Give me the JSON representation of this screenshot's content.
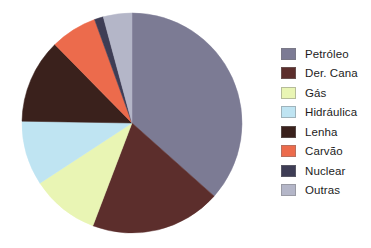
{
  "chart_data": {
    "type": "pie",
    "title": "",
    "subtitle": "",
    "xlabel": "",
    "ylabel": "",
    "grid": false,
    "legend_position": "right",
    "start_angle_deg": 0,
    "direction": "clockwise",
    "units": "percent",
    "categories": [
      "Petróleo",
      "Der. Cana",
      "Gás",
      "Hidráulica",
      "Lenha",
      "Carvão",
      "Nuclear",
      "Outras"
    ],
    "values": [
      38.6,
      20.3,
      10.6,
      10.0,
      13.1,
      7.2,
      1.4,
      4.4
    ],
    "angles_deg": [
      139.0,
      73.0,
      38.0,
      36.0,
      47.0,
      26.0,
      5.0,
      16.0
    ],
    "colors": [
      "#7c7b94",
      "#5c2e2c",
      "#e9f5b4",
      "#bfe4f2",
      "#3a211c",
      "#ec6b4c",
      "#3e3d55",
      "#b4b6c8"
    ],
    "slices": [
      {
        "label": "Petróleo",
        "value": 38.6,
        "angle_deg": 139.0,
        "color": "#7c7b94"
      },
      {
        "label": "Der. Cana",
        "value": 20.3,
        "angle_deg": 73.0,
        "color": "#5c2e2c"
      },
      {
        "label": "Gás",
        "value": 10.6,
        "angle_deg": 38.0,
        "color": "#e9f5b4"
      },
      {
        "label": "Hidráulica",
        "value": 10.0,
        "angle_deg": 36.0,
        "color": "#bfe4f2"
      },
      {
        "label": "Lenha",
        "value": 13.1,
        "angle_deg": 47.0,
        "color": "#3a211c"
      },
      {
        "label": "Carvão",
        "value": 7.2,
        "angle_deg": 26.0,
        "color": "#ec6b4c"
      },
      {
        "label": "Nuclear",
        "value": 1.4,
        "angle_deg": 5.0,
        "color": "#3e3d55"
      },
      {
        "label": "Outras",
        "value": 4.4,
        "angle_deg": 16.0,
        "color": "#b4b6c8"
      }
    ]
  },
  "legend": {
    "items": [
      {
        "label": "Petróleo",
        "color": "#7c7b94"
      },
      {
        "label": "Der. Cana",
        "color": "#5c2e2c"
      },
      {
        "label": "Gás",
        "color": "#e9f5b4"
      },
      {
        "label": "Hidráulica",
        "color": "#bfe4f2"
      },
      {
        "label": "Lenha",
        "color": "#3a211c"
      },
      {
        "label": "Carvão",
        "color": "#ec6b4c"
      },
      {
        "label": "Nuclear",
        "color": "#3e3d55"
      },
      {
        "label": "Outras",
        "color": "#b4b6c8"
      }
    ]
  },
  "geometry": {
    "center_x": 132,
    "center_y": 123,
    "radius": 110
  }
}
